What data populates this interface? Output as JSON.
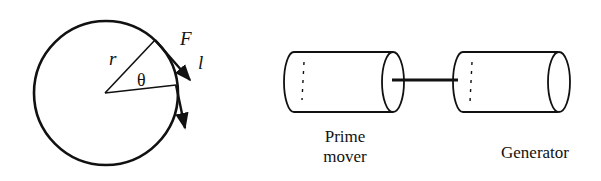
{
  "left_figure": {
    "labels": {
      "radius": "r",
      "angle": "θ",
      "force": "F",
      "length": "l"
    }
  },
  "right_figure": {
    "prime_mover_line1": "Prime",
    "prime_mover_line2": "mover",
    "generator": "Generator"
  },
  "colors": {
    "stroke": "#111111",
    "background": "#ffffff"
  }
}
